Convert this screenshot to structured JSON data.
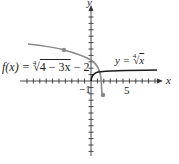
{
  "chart_data": {
    "type": "line",
    "title": "",
    "xlabel": "x",
    "ylabel": "y",
    "xlim": [
      -11,
      11
    ],
    "ylim": [
      -12,
      12
    ],
    "grid": false,
    "tick_labels": {
      "x": [
        "-1",
        "5"
      ],
      "y": []
    },
    "series": [
      {
        "name": "y = ⁴√x",
        "color": "#1a1a1a",
        "x": [
          0,
          0.1,
          0.5,
          1,
          2,
          4,
          6,
          8,
          10.5
        ],
        "y": [
          0,
          0.56,
          0.84,
          1,
          1.19,
          1.41,
          1.57,
          1.68,
          1.8
        ]
      },
      {
        "name": "f(x) = ⁴√(4 − 3x) − 2",
        "color": "#8a8a8a",
        "x": [
          -10,
          -8,
          -6,
          -4.3,
          -2,
          0,
          1,
          1.5,
          1.8,
          1.9
        ],
        "y": [
          5.9,
          5.6,
          5.25,
          4.9,
          4.2,
          3.3,
          2.4,
          1.2,
          -0.5,
          -2.2
        ],
        "marked_points": [
          [
            -4.3,
            4.9
          ],
          [
            1.9,
            -2.2
          ]
        ]
      }
    ],
    "annotations": [
      "f(x) = ⁴√(4 − 3x) − 2",
      "y = ⁴√x"
    ]
  },
  "labels": {
    "x_axis": "x",
    "y_axis": "y",
    "tick_neg1": "−1",
    "tick_5": "5",
    "fx_prefix": "f(x) = ",
    "fx_index": "4",
    "fx_radicand": "4 − 3x",
    "fx_suffix": " − 2",
    "yx_prefix": "y = ",
    "yx_index": "4",
    "yx_radicand": "x"
  }
}
